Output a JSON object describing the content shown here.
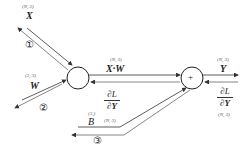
{
  "nodes": {
    "matmul": {
      "symbol": ""
    },
    "add": {
      "symbol": "+"
    }
  },
  "inputs": {
    "x": {
      "label": "X",
      "shape": "(N, 2)"
    },
    "w": {
      "label": "W",
      "shape": "(2, 3)"
    },
    "b": {
      "label": "B",
      "shape": "(3,)"
    }
  },
  "intermediate": {
    "label": "X·W",
    "shape": "(N, 3)"
  },
  "output": {
    "label": "Y",
    "shape": "(N, 3)"
  },
  "gradients": {
    "output_grad": {
      "numerator": "∂L",
      "denominator": "∂Y",
      "shape": "(N, 3)"
    },
    "xw_grad": {
      "numerator": "∂L",
      "denominator": "∂Y"
    },
    "b_grad_shape": "(N, 3)"
  },
  "steps": [
    "①",
    "②",
    "③"
  ]
}
